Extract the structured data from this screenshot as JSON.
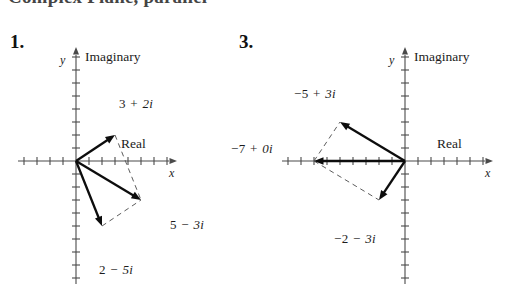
{
  "header": {
    "cropped_text": "Complex Plane, parallel"
  },
  "figures": [
    {
      "number_label": "1.",
      "axis": {
        "y_var": "y",
        "y_name": "Imaginary",
        "x_var": "x",
        "x_name": "Real"
      },
      "origin": {
        "x": 76,
        "y": 161
      },
      "unit": 13,
      "x_range": [
        -4,
        7
      ],
      "y_range": [
        -9,
        8
      ],
      "points": [
        {
          "label_num": "3",
          "label_op": "+",
          "label_im": "2i",
          "re": 3,
          "im": 2,
          "label_x": 119,
          "label_y": 96
        },
        {
          "label_num": "5",
          "label_op": "−",
          "label_im": "3i",
          "re": 5,
          "im": -3,
          "label_x": 170,
          "label_y": 217
        },
        {
          "label_num": "2",
          "label_op": "−",
          "label_im": "5i",
          "re": 2,
          "im": -5,
          "label_x": 99,
          "label_y": 262
        }
      ],
      "vectors_solid": [
        {
          "from": [
            0,
            0
          ],
          "to": [
            3,
            2
          ]
        },
        {
          "from": [
            0,
            0
          ],
          "to": [
            5,
            -3
          ]
        },
        {
          "from": [
            0,
            0
          ],
          "to": [
            2,
            -5
          ]
        }
      ],
      "vectors_dashed": [
        {
          "from": [
            3,
            2
          ],
          "to": [
            5,
            -3
          ]
        },
        {
          "from": [
            2,
            -5
          ],
          "to": [
            5,
            -3
          ]
        }
      ]
    },
    {
      "number_label": "3.",
      "axis": {
        "y_var": "y",
        "y_name": "Imaginary",
        "x_var": "x",
        "x_name": "Real"
      },
      "origin": {
        "x": 405,
        "y": 161
      },
      "unit": 13,
      "x_range": [
        -9,
        6
      ],
      "y_range": [
        -9,
        8
      ],
      "points": [
        {
          "label_num": "−5",
          "label_op": "+",
          "label_im": "3i",
          "re": -5,
          "im": 3,
          "label_x": 294,
          "label_y": 86
        },
        {
          "label_num": "−7",
          "label_op": "+",
          "label_im": "0i",
          "re": -7,
          "im": 0,
          "label_x": 231,
          "label_y": 141
        },
        {
          "label_num": "−2",
          "label_op": "−",
          "label_im": "3i",
          "re": -2,
          "im": -3,
          "label_x": 334,
          "label_y": 231
        }
      ],
      "vectors_solid": [
        {
          "from": [
            0,
            0
          ],
          "to": [
            -5,
            3
          ]
        },
        {
          "from": [
            0,
            0
          ],
          "to": [
            -7,
            0
          ]
        },
        {
          "from": [
            0,
            0
          ],
          "to": [
            -2,
            -3
          ]
        }
      ],
      "vectors_dashed": [
        {
          "from": [
            -7,
            0
          ],
          "to": [
            -5,
            3
          ]
        },
        {
          "from": [
            -7,
            0
          ],
          "to": [
            -2,
            -3
          ]
        }
      ]
    }
  ],
  "colors": {
    "ink": "#0d0d0d",
    "axis": "#4a4a4a",
    "dashed": "#5d5d5d",
    "background": "#ffffff"
  }
}
